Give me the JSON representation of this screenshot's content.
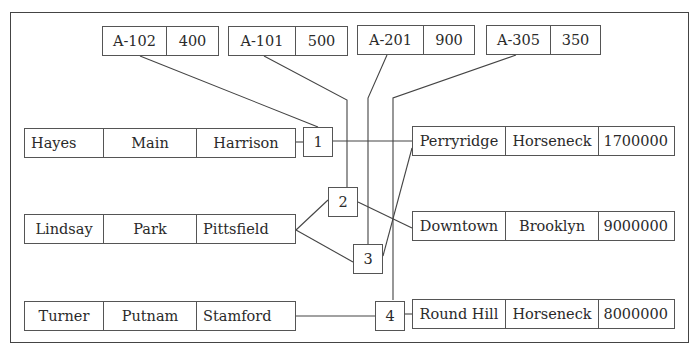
{
  "diagram": {
    "type": "relational-pointer-diagram",
    "accounts": [
      {
        "account_number": "A-102",
        "balance": "400"
      },
      {
        "account_number": "A-101",
        "balance": "500"
      },
      {
        "account_number": "A-201",
        "balance": "900"
      },
      {
        "account_number": "A-305",
        "balance": "350"
      }
    ],
    "customers": [
      {
        "name": "Hayes",
        "street": "Main",
        "city": "Harrison"
      },
      {
        "name": "Lindsay",
        "street": "Park",
        "city": "Pittsfield"
      },
      {
        "name": "Turner",
        "street": "Putnam",
        "city": "Stamford"
      }
    ],
    "pointers": [
      {
        "label": "1"
      },
      {
        "label": "2"
      },
      {
        "label": "3"
      },
      {
        "label": "4"
      }
    ],
    "branches": [
      {
        "name": "Perryridge",
        "city": "Horseneck",
        "assets": "1700000"
      },
      {
        "name": "Downtown",
        "city": "Brooklyn",
        "assets": "9000000"
      },
      {
        "name": "Round Hill",
        "city": "Horseneck",
        "assets": "8000000"
      }
    ],
    "links": [
      {
        "from": "A-102",
        "to": "1"
      },
      {
        "from": "A-101",
        "to": "2"
      },
      {
        "from": "A-201",
        "to": "3"
      },
      {
        "from": "A-305",
        "to": "4"
      },
      {
        "from": "Hayes",
        "to": "1"
      },
      {
        "from": "Lindsay",
        "to": "2"
      },
      {
        "from": "Lindsay",
        "to": "3"
      },
      {
        "from": "Turner",
        "to": "4"
      },
      {
        "from": "1",
        "to": "Perryridge"
      },
      {
        "from": "2",
        "to": "Downtown"
      },
      {
        "from": "3",
        "to": "Perryridge"
      },
      {
        "from": "4",
        "to": "Round Hill"
      }
    ],
    "colors": {
      "line": "#444444",
      "border": "#555555",
      "text": "#2a2a2a",
      "background": "#ffffff"
    }
  }
}
